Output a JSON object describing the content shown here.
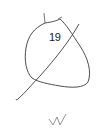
{
  "diagram": {
    "label": "19",
    "mark": "N",
    "stroke_color": "#3a3a3a",
    "background": "#ffffff"
  }
}
